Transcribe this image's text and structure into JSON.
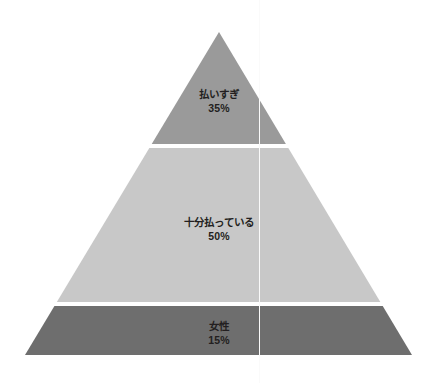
{
  "chart_data": {
    "type": "pie",
    "subtype": "pyramid",
    "title": "",
    "subtitle": "",
    "xlabel": "",
    "ylabel": "",
    "legend": "none",
    "grid": false,
    "categories": [
      "払いすぎ",
      "十分払っている",
      "女性"
    ],
    "values": [
      35,
      50,
      15
    ],
    "value_labels": [
      "35%",
      "50%",
      "15%"
    ],
    "unit": "%",
    "total": 100,
    "order": "top-to-bottom",
    "series": [
      {
        "name": "share",
        "values": [
          35,
          50,
          15
        ]
      }
    ],
    "segments": [
      {
        "label": "払いすぎ",
        "value": 35,
        "value_label": "35%",
        "color": "#9a9a9a",
        "position": "top"
      },
      {
        "label": "十分払っている",
        "value": 50,
        "value_label": "50%",
        "color": "#c8c8c8",
        "position": "middle"
      },
      {
        "label": "女性",
        "value": 15,
        "value_label": "15%",
        "color": "#6e6e6e",
        "position": "bottom"
      }
    ]
  },
  "colors": {
    "background": "#ffffff",
    "divider": "#ffffff",
    "guide_line": "#fafafa",
    "text": "#231f20",
    "segment_top": "#9a9a9a",
    "segment_middle": "#c8c8c8",
    "segment_bottom": "#6e6e6e"
  },
  "geometry": {
    "apex_x": 219,
    "apex_y": 32,
    "base_left_x": 25,
    "base_right_x": 412,
    "base_y": 355,
    "divider1_y": 146,
    "divider2_y": 304,
    "divider_thickness": 4,
    "guide_line_x": 259
  }
}
